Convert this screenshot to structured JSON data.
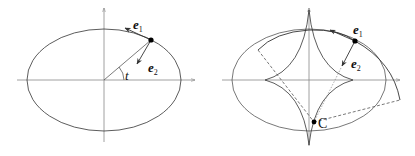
{
  "figure": {
    "panels": [
      {
        "id": "left",
        "description": "Ellipse with moving frame e1, e2 at a point parameterized by angle t",
        "labels": {
          "e1_base": "e",
          "e1_sub": "1",
          "e2_base": "e",
          "e2_sub": "2",
          "angle": "t"
        }
      },
      {
        "id": "right",
        "description": "Ellipse with its evolute (astroid-like curve), moving frame e1, e2 and center of curvature C",
        "labels": {
          "e1_base": "e",
          "e1_sub": "1",
          "e2_base": "e",
          "e2_sub": "2",
          "point": "C"
        }
      }
    ],
    "colors": {
      "stroke": "#333333",
      "axis": "#777777",
      "dashed": "#555555",
      "point": "#000000"
    }
  }
}
